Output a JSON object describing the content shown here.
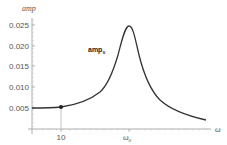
{
  "chart_data": {
    "type": "line",
    "title": "",
    "xlabel": "ω",
    "ylabel": "amp",
    "x_ticks": [
      {
        "label": "10",
        "value": 10
      },
      {
        "label": "ω₀",
        "value": "omega0"
      }
    ],
    "y_ticks": [
      "0.005",
      "0.010",
      "0.015",
      "0.020",
      "0.025"
    ],
    "ylim": [
      0,
      0.027
    ],
    "grid": false,
    "legend": null,
    "series": [
      {
        "name": "ampₛ",
        "description": "resonance amplitude curve peaking at ω₀",
        "points": [
          {
            "x_px": 32,
            "y": 0.0051
          },
          {
            "x_px": 61,
            "y": 0.0055
          },
          {
            "x_px": 80,
            "y": 0.0065
          },
          {
            "x_px": 95,
            "y": 0.0085
          },
          {
            "x_px": 105,
            "y": 0.011
          },
          {
            "x_px": 113,
            "y": 0.015
          },
          {
            "x_px": 120,
            "y": 0.0205
          },
          {
            "x_px": 125,
            "y": 0.0245
          },
          {
            "x_px": 129,
            "y": 0.0255
          },
          {
            "x_px": 133,
            "y": 0.0235
          },
          {
            "x_px": 138,
            "y": 0.0185
          },
          {
            "x_px": 145,
            "y": 0.0125
          },
          {
            "x_px": 155,
            "y": 0.0085
          },
          {
            "x_px": 170,
            "y": 0.0055
          },
          {
            "x_px": 190,
            "y": 0.0035
          },
          {
            "x_px": 206,
            "y": 0.0026
          }
        ]
      }
    ],
    "annotations": [
      {
        "type": "point",
        "x_label": "10",
        "y": 0.0055,
        "with_drop_line": true
      },
      {
        "type": "text",
        "text": "amp",
        "subscript": "s"
      }
    ]
  },
  "labels": {
    "y_axis_title": "amp",
    "x_axis_title": "ω",
    "series_label_main": "amp",
    "series_label_sub": "s",
    "x_tick_10": "10",
    "x_tick_omega0_main": "ω",
    "x_tick_omega0_sub": "0",
    "y_tick_0": "0.005",
    "y_tick_1": "0.010",
    "y_tick_2": "0.015",
    "y_tick_3": "0.020",
    "y_tick_4": "0.025"
  },
  "colors": {
    "curve": "#333333",
    "axis": "#999999",
    "marker": "#222222",
    "drop_line": "#bbbbbb"
  }
}
